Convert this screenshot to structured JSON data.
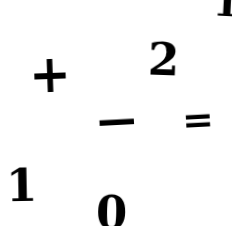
{
  "sheet": {
    "kind": "handwritten-glyph-scan",
    "background_color": "#ffffff",
    "ink_color": "#171717",
    "width": 232,
    "height": 226,
    "glyph_count": 7,
    "description": "Scanned sheet of loose handwritten mathematical symbols and digits"
  },
  "glyphs": [
    {
      "id": "corner-one",
      "text": "1",
      "kind": "digit",
      "cropped": "true",
      "position": "top-right-edge"
    },
    {
      "id": "plus",
      "text": "+",
      "kind": "operator",
      "name": "plus-sign",
      "position": "upper-left"
    },
    {
      "id": "two",
      "text": "2",
      "kind": "digit",
      "position": "upper-right-center"
    },
    {
      "id": "minus",
      "text": "−",
      "kind": "operator",
      "name": "minus-sign",
      "position": "middle-center"
    },
    {
      "id": "equals",
      "text": "=",
      "kind": "operator",
      "name": "equals-sign",
      "position": "middle-right"
    },
    {
      "id": "one",
      "text": "1",
      "kind": "digit",
      "position": "lower-left"
    },
    {
      "id": "zero",
      "text": "0",
      "kind": "digit",
      "cropped": "true",
      "position": "bottom-center"
    }
  ]
}
